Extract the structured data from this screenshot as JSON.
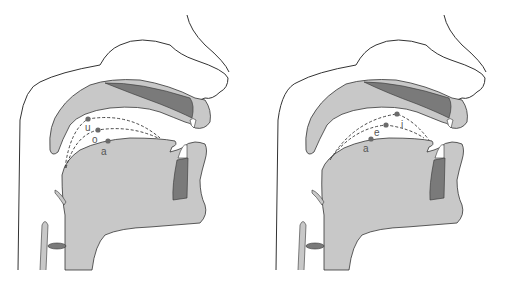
{
  "colors": {
    "outline": "#333333",
    "tissue": "#c8c8c8",
    "bone": "#7a7a7a",
    "marker": "#6b6b6b",
    "dash": "#333333",
    "background": "#ffffff"
  },
  "panels": [
    {
      "id": "back-vowels",
      "vowels": [
        {
          "label": "u",
          "x": 88,
          "y": 119,
          "lx": 86,
          "ly": 131
        },
        {
          "label": "o",
          "x": 98,
          "y": 130,
          "lx": 93,
          "ly": 143
        },
        {
          "label": "a",
          "x": 108,
          "y": 141,
          "lx": 102,
          "ly": 154
        }
      ]
    },
    {
      "id": "front-vowels",
      "vowels": [
        {
          "label": "i",
          "x": 143,
          "y": 114,
          "lx": 148,
          "ly": 128
        },
        {
          "label": "e",
          "x": 132,
          "y": 125,
          "lx": 120,
          "ly": 136
        },
        {
          "label": "a",
          "x": 117,
          "y": 139,
          "lx": 110,
          "ly": 152
        }
      ]
    }
  ]
}
